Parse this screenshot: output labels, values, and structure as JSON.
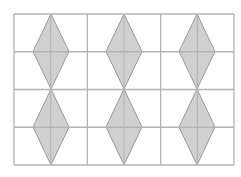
{
  "diagram": {
    "grid": {
      "x0": 14,
      "y0": 14,
      "x1": 234,
      "y1": 165,
      "cols": 6,
      "rows": 4,
      "line_color": "#b3b3b3"
    },
    "shape_fill": "#d0d0d0",
    "shape_stroke": "#9a9a9a",
    "diamonds": [
      {
        "cx": 51,
        "top": 14,
        "bottom": 89,
        "half_w": 18
      },
      {
        "cx": 124,
        "top": 14,
        "bottom": 89,
        "half_w": 18
      },
      {
        "cx": 197,
        "top": 14,
        "bottom": 89,
        "half_w": 18
      },
      {
        "cx": 51,
        "top": 89,
        "bottom": 165,
        "half_w": 18
      },
      {
        "cx": 124,
        "top": 89,
        "bottom": 165,
        "half_w": 18
      },
      {
        "cx": 197,
        "top": 89,
        "bottom": 165,
        "half_w": 18
      }
    ]
  }
}
